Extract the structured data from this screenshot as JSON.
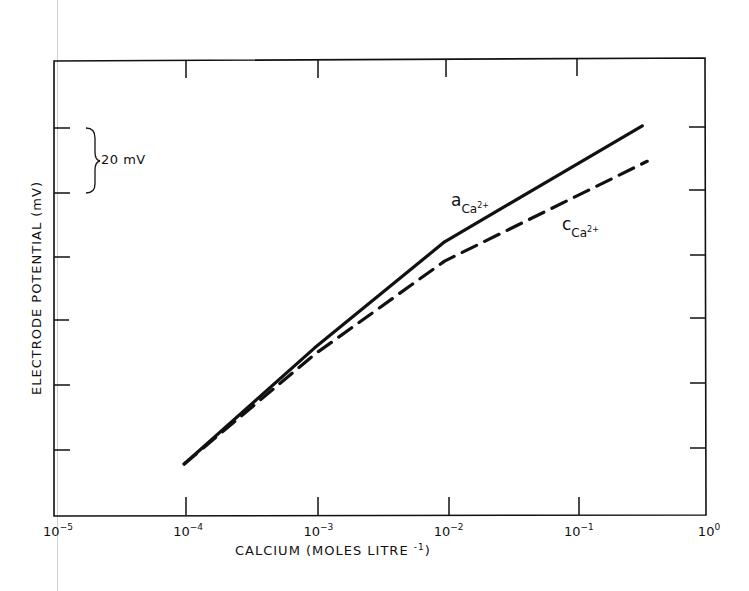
{
  "chart_data": {
    "type": "line",
    "title": "",
    "xlabel": "CALCIUM (MOLES LITRE",
    "xlabel_sup": "-1",
    "xlabel_close": ")",
    "ylabel": "ELECTRODE POTENTIAL (mV)",
    "xscale": "log",
    "xlim": [
      1e-05,
      1
    ],
    "x_ticks": [
      {
        "base": "10",
        "exp": "-5"
      },
      {
        "base": "10",
        "exp": "-4"
      },
      {
        "base": "10",
        "exp": "-3"
      },
      {
        "base": "10",
        "exp": "-2"
      },
      {
        "base": "10",
        "exp": "-1"
      },
      {
        "base": "10",
        "exp": "0"
      }
    ],
    "y_tick_spacing_mV": 20,
    "y_values_relative_to": "potential at 1e-4 M (0 mV)",
    "scale_bar_label": "20 mV",
    "grid": false,
    "legend": "inline labels",
    "series": [
      {
        "name": "a Ca2+ (activity)",
        "label_main": "a",
        "label_sub": "Ca",
        "label_sup": "2+",
        "style": "solid",
        "x": [
          0.0001,
          0.001,
          0.01,
          0.33
        ],
        "values": [
          0,
          36,
          69,
          105
        ]
      },
      {
        "name": "c Ca2+ (concentration)",
        "label_main": "c",
        "label_sub": "Ca",
        "label_sup": "2+",
        "style": "dashed",
        "x": [
          0.0001,
          0.001,
          0.01,
          0.36
        ],
        "values": [
          0,
          34,
          63,
          94
        ]
      }
    ]
  },
  "colors": {
    "ink": "#111111",
    "background": "#ffffff",
    "scan_artifact": "#cfcfcf"
  }
}
